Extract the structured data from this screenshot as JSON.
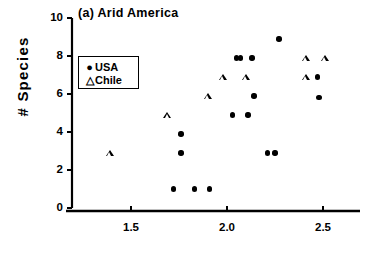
{
  "chart_data": {
    "type": "scatter",
    "title": "(a) Arid America",
    "xlabel": "",
    "ylabel": "# Species",
    "xlim": [
      1.27,
      2.7
    ],
    "ylim": [
      0,
      10
    ],
    "xticks": [
      1.5,
      2.0,
      2.5
    ],
    "xtick_labels": [
      "1.5",
      "2.0",
      "2.5"
    ],
    "yticks": [
      0,
      2,
      4,
      6,
      8,
      10
    ],
    "ytick_labels": [
      "0",
      "2",
      "4",
      "6",
      "8",
      "10"
    ],
    "grid": false,
    "legend_position": "upper left",
    "series": [
      {
        "name": "USA",
        "marker": "filled-circle",
        "color": "#000000",
        "points": [
          {
            "x": 2.27,
            "y": 8.9
          },
          {
            "x": 2.05,
            "y": 7.9
          },
          {
            "x": 2.07,
            "y": 7.9
          },
          {
            "x": 2.13,
            "y": 7.9
          },
          {
            "x": 2.47,
            "y": 6.9
          },
          {
            "x": 2.14,
            "y": 5.9
          },
          {
            "x": 2.48,
            "y": 5.8
          },
          {
            "x": 2.03,
            "y": 4.9
          },
          {
            "x": 2.11,
            "y": 4.9
          },
          {
            "x": 1.76,
            "y": 3.9
          },
          {
            "x": 1.76,
            "y": 2.9
          },
          {
            "x": 2.21,
            "y": 2.9
          },
          {
            "x": 2.25,
            "y": 2.9
          },
          {
            "x": 1.72,
            "y": 1.0
          },
          {
            "x": 1.83,
            "y": 1.0
          },
          {
            "x": 1.91,
            "y": 1.0
          }
        ]
      },
      {
        "name": "Chile",
        "marker": "open-triangle",
        "color": "#000000",
        "points": [
          {
            "x": 2.41,
            "y": 7.9
          },
          {
            "x": 2.51,
            "y": 7.9
          },
          {
            "x": 1.98,
            "y": 6.9
          },
          {
            "x": 2.1,
            "y": 6.9
          },
          {
            "x": 2.41,
            "y": 6.9
          },
          {
            "x": 1.9,
            "y": 5.9
          },
          {
            "x": 1.69,
            "y": 4.9
          },
          {
            "x": 1.39,
            "y": 2.9
          }
        ]
      }
    ]
  },
  "legend": {
    "items": [
      {
        "marker": "●",
        "label": "USA"
      },
      {
        "marker": "△",
        "label": "Chile"
      }
    ]
  }
}
